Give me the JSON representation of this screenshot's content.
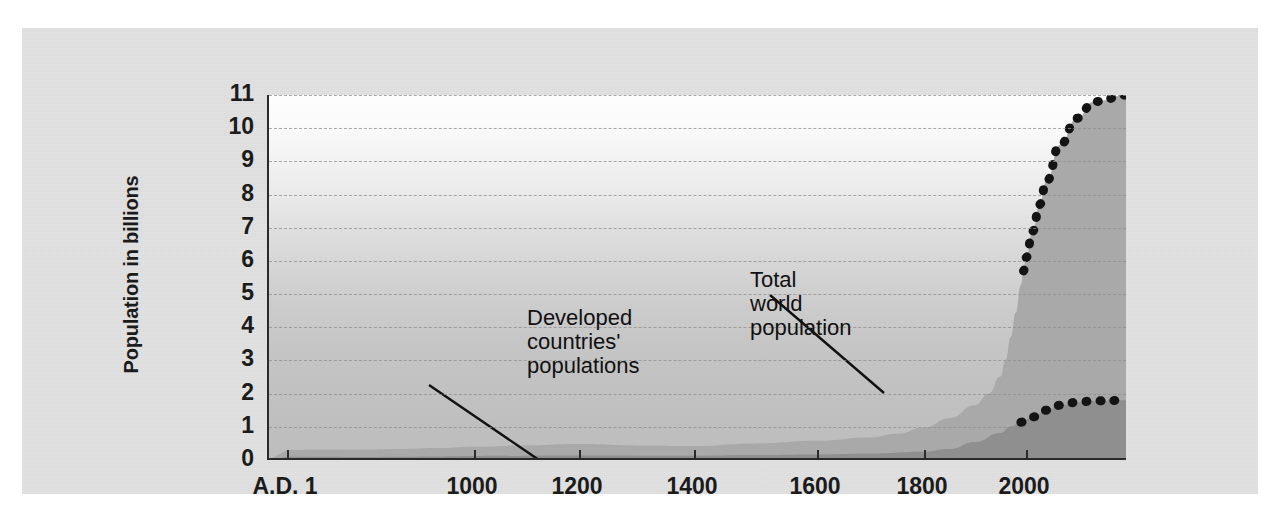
{
  "figure": {
    "caption_sliver": "Figure: world population growth",
    "background_color": "#e2e2e2",
    "plot_area_gradient_top": "#fdfdfd",
    "plot_area_gradient_bottom": "#bdbdbd",
    "total_band_color": "#a9a9a9",
    "developed_band_color": "#8f8f8f",
    "projection_dot_color": "#141414",
    "axis_color": "#2a2a2a",
    "gridline_color": "#8e8e8e"
  },
  "axes": {
    "y_title": "Population in billions",
    "y_ticks": [
      "11",
      "10",
      "9",
      "8",
      "7",
      "6",
      "5",
      "4",
      "3",
      "2",
      "1",
      "0"
    ],
    "y_min": 0,
    "y_max": 11,
    "x_ticks": [
      "A.D. 1",
      "1000",
      "1200",
      "1400",
      "1600",
      "1800",
      "2000"
    ],
    "x_min": 1,
    "x_max": 2150
  },
  "annotations": [
    {
      "name": "developed-countries-label",
      "text": "Developed\ncountries'\npopulations"
    },
    {
      "name": "total-world-population-label",
      "text": "Total\nworld\npopulation"
    }
  ],
  "chart_data": {
    "type": "area",
    "title": "",
    "subtitle": "",
    "xlabel": "",
    "ylabel": "Population in billions",
    "xlim": [
      1,
      2150
    ],
    "ylim": [
      0,
      11
    ],
    "grid": true,
    "legend": "annotations-with-leader-lines",
    "x_tick_values": [
      1,
      1000,
      1200,
      1400,
      1600,
      1800,
      2000
    ],
    "x_tick_labels": [
      "A.D. 1",
      "1000",
      "1200",
      "1400",
      "1600",
      "1800",
      "2000"
    ],
    "y_tick_values": [
      0,
      1,
      2,
      3,
      4,
      5,
      6,
      7,
      8,
      9,
      10,
      11
    ],
    "series": [
      {
        "name": "Total world population",
        "kind": "area-historical",
        "x": [
          1,
          200,
          400,
          600,
          800,
          1000,
          1100,
          1200,
          1300,
          1400,
          1500,
          1600,
          1700,
          1750,
          1800,
          1850,
          1900,
          1927,
          1950,
          1960,
          1970,
          1980,
          1990,
          1995
        ],
        "values": [
          0.3,
          0.32,
          0.31,
          0.33,
          0.36,
          0.4,
          0.44,
          0.48,
          0.44,
          0.42,
          0.5,
          0.58,
          0.68,
          0.79,
          0.98,
          1.26,
          1.65,
          2.0,
          2.52,
          3.02,
          3.7,
          4.44,
          5.27,
          5.7
        ]
      },
      {
        "name": "Total world population (projected)",
        "kind": "dotted-projection",
        "x": [
          1995,
          2000,
          2010,
          2020,
          2030,
          2050,
          2075,
          2100,
          2150
        ],
        "values": [
          5.7,
          6.1,
          6.9,
          7.7,
          8.4,
          9.5,
          10.3,
          10.8,
          11.0
        ]
      },
      {
        "name": "Developed countries' populations",
        "kind": "area-historical",
        "x": [
          1,
          200,
          400,
          600,
          800,
          1000,
          1200,
          1400,
          1500,
          1600,
          1700,
          1800,
          1850,
          1900,
          1950,
          1970,
          1990
        ],
        "values": [
          0.1,
          0.1,
          0.09,
          0.1,
          0.11,
          0.12,
          0.14,
          0.13,
          0.15,
          0.17,
          0.2,
          0.25,
          0.33,
          0.54,
          0.81,
          1.01,
          1.14
        ]
      },
      {
        "name": "Developed countries' populations (projected)",
        "kind": "dotted-projection",
        "x": [
          1990,
          2010,
          2030,
          2050,
          2075,
          2100,
          2150
        ],
        "values": [
          1.14,
          1.3,
          1.5,
          1.65,
          1.74,
          1.78,
          1.8
        ]
      }
    ]
  }
}
